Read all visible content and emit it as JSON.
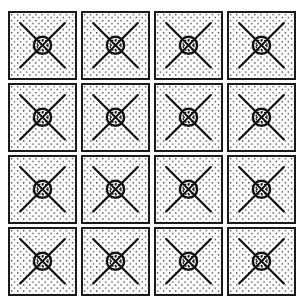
{
  "pattern": {
    "rows": 4,
    "columns": 4,
    "tile_motif": "stippled square with diagonal X and central circle",
    "colors": {
      "border": "#1a1a1a",
      "background": "#ffffff",
      "dots": "#2a2a2a",
      "lines": "#111111"
    },
    "tiles": [
      {
        "row": 1,
        "col": 1
      },
      {
        "row": 1,
        "col": 2
      },
      {
        "row": 1,
        "col": 3
      },
      {
        "row": 1,
        "col": 4
      },
      {
        "row": 2,
        "col": 1
      },
      {
        "row": 2,
        "col": 2
      },
      {
        "row": 2,
        "col": 3
      },
      {
        "row": 2,
        "col": 4
      },
      {
        "row": 3,
        "col": 1
      },
      {
        "row": 3,
        "col": 2
      },
      {
        "row": 3,
        "col": 3
      },
      {
        "row": 3,
        "col": 4
      },
      {
        "row": 4,
        "col": 1
      },
      {
        "row": 4,
        "col": 2
      },
      {
        "row": 4,
        "col": 3
      },
      {
        "row": 4,
        "col": 4
      }
    ]
  }
}
